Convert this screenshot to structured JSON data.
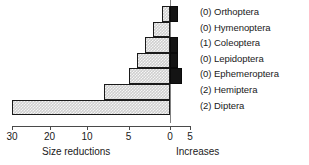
{
  "chart_data": {
    "type": "bar",
    "orientation": "horizontal-diverging",
    "title": "",
    "xlabel": "",
    "ylabel": "",
    "left_axis_caption": "Size reductions",
    "right_axis_caption": "Increases",
    "tick_labels": [
      "30",
      "20",
      "10",
      "5",
      "0",
      "5"
    ],
    "tick_values": [
      -30,
      -20,
      -10,
      -5,
      0,
      5
    ],
    "grid": false,
    "legend_position": "right",
    "categories": [
      "(0) Orthoptera",
      "(0) Hymenoptera",
      "(1) Coleoptera",
      "(0) Lepidoptera",
      "(0) Ephemeroptera",
      "(2) Hemiptera",
      "(2) Diptera"
    ],
    "series": [
      {
        "name": "Size reductions",
        "color": "#cfcfcf",
        "values": [
          1,
          2,
          3,
          4,
          5,
          8,
          30
        ]
      },
      {
        "name": "Increases",
        "color": "#141414",
        "values": [
          2,
          0,
          2,
          2,
          3,
          0,
          0
        ]
      }
    ]
  },
  "axis": {
    "left_caption": "Size reductions",
    "right_caption": "Increases",
    "ticks": [
      {
        "label": "30",
        "value": -30
      },
      {
        "label": "20",
        "value": -20
      },
      {
        "label": "10",
        "value": -10
      },
      {
        "label": "5",
        "value": -5
      },
      {
        "label": "0",
        "value": 0
      },
      {
        "label": "5",
        "value": 5
      }
    ]
  },
  "legend": {
    "items": [
      {
        "label": "(0) Orthoptera"
      },
      {
        "label": "(0) Hymenoptera"
      },
      {
        "label": "(1) Coleoptera"
      },
      {
        "label": "(0) Lepidoptera"
      },
      {
        "label": "(0) Ephemeroptera"
      },
      {
        "label": "(2) Hemiptera"
      },
      {
        "label": "(2) Diptera"
      }
    ]
  }
}
